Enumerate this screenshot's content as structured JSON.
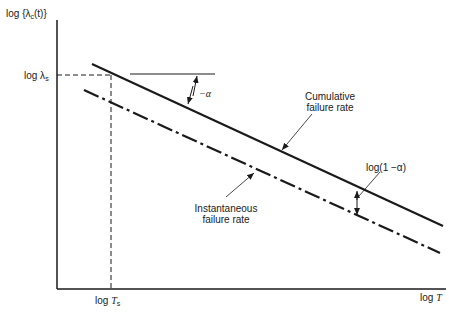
{
  "y_axis": {
    "label_prefix": "log",
    "label_main": "{λ",
    "label_sub": "c",
    "label_suffix": "(t)}"
  },
  "x_axis": {
    "label_prefix": "log",
    "label_var": "T"
  },
  "y_marker": {
    "prefix": "log λ",
    "sub": "s"
  },
  "x_marker": {
    "prefix": "log ",
    "var": "T",
    "sub": "s"
  },
  "annotations": {
    "slope": "−α",
    "offset": "log(1 −α)",
    "cumulative_line1": "Cumulative",
    "cumulative_line2": "failure rate",
    "instantaneous_line1": "Instantaneous",
    "instantaneous_line2": "failure rate"
  },
  "lines": {
    "cumulative": {
      "style": "solid",
      "from": [
        92,
        64
      ],
      "to": [
        443,
        226
      ]
    },
    "instantaneous": {
      "style": "dash-dot",
      "from": [
        84,
        90
      ],
      "to": [
        440,
        253
      ]
    }
  },
  "colors": {
    "ink": "#1a1a1a",
    "background": "#ffffff"
  }
}
